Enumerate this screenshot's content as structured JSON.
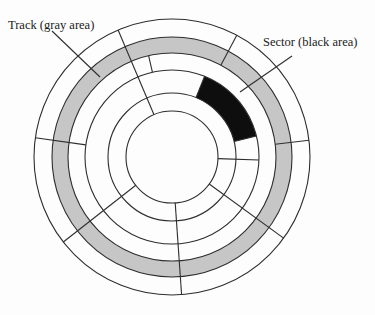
{
  "figure": {
    "background": "#fdfdfd",
    "line_color": "#2e2e2e",
    "track_fill": "#c6c6c6",
    "sector_fill": "#0e0e0e",
    "center": {
      "x": 172,
      "y": 157
    },
    "radii": [
      138,
      120,
      104,
      87,
      64,
      46
    ],
    "gray_track": {
      "outer_r": 120,
      "inner_r": 104
    },
    "black_sector": {
      "outer_r": 87,
      "inner_r": 64,
      "start_angle_deg": 14,
      "end_angle_deg": 68
    },
    "sector_boundaries": [
      {
        "angle_deg": 113,
        "r_from": 46,
        "r_to": 138
      },
      {
        "angle_deg": 172,
        "r_from": 87,
        "r_to": 138
      },
      {
        "angle_deg": 218,
        "r_from": 46,
        "r_to": 138
      },
      {
        "angle_deg": 274,
        "r_from": 46,
        "r_to": 138
      },
      {
        "angle_deg": 324,
        "r_from": 46,
        "r_to": 138
      },
      {
        "angle_deg": 7,
        "r_from": 104,
        "r_to": 138
      },
      {
        "angle_deg": 62,
        "r_from": 104,
        "r_to": 138
      },
      {
        "angle_deg": 103,
        "r_from": 87,
        "r_to": 104
      },
      {
        "angle_deg": -2,
        "r_from": 46,
        "r_to": 87
      },
      {
        "angle_deg": 14,
        "r_from": 64,
        "r_to": 87
      },
      {
        "angle_deg": 68,
        "r_from": 64,
        "r_to": 87
      }
    ],
    "labels": {
      "track": {
        "text": "Track (gray area)",
        "pointer": {
          "x1": 52,
          "y1": 31,
          "x2": 100,
          "y2": 77
        }
      },
      "sector": {
        "text": "Sector (black area)",
        "pointer": {
          "x1": 292,
          "y1": 56,
          "x2": 240,
          "y2": 92
        }
      }
    }
  }
}
